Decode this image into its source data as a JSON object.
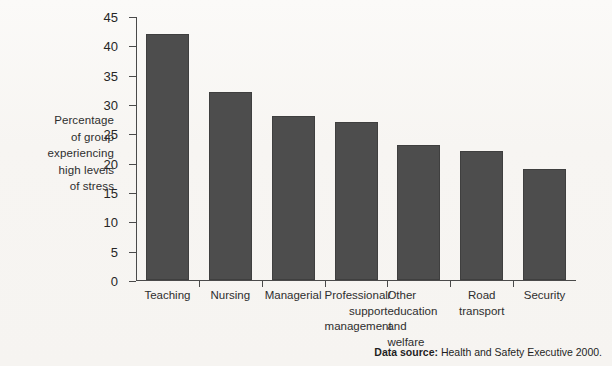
{
  "chart_data": {
    "type": "bar",
    "title": "",
    "xlabel": "",
    "ylabel": "Percentage of group experiencing high levels of stress",
    "ylim": [
      0,
      45
    ],
    "ytick_step": 5,
    "grid": false,
    "legend": "none",
    "bar_color": "#4d4d4d",
    "categories": [
      "Teaching",
      "Nursing",
      "Managerial",
      "Professional/ support management",
      "Other education and welfare",
      "Road transport",
      "Security"
    ],
    "values": [
      42,
      32,
      28,
      27,
      23,
      22,
      19
    ],
    "yticks": [
      "0",
      "5",
      "10",
      "15",
      "20",
      "25",
      "30",
      "35",
      "40",
      "45"
    ]
  },
  "y_axis_title_lines": [
    "Percentage",
    "of group",
    "experiencing",
    "high levels",
    "of stress"
  ],
  "category_labels": [
    {
      "lines": [
        "Teaching"
      ],
      "align": "center"
    },
    {
      "lines": [
        "Nursing"
      ],
      "align": "center"
    },
    {
      "lines": [
        "Managerial"
      ],
      "align": "center"
    },
    {
      "lines": [
        "Professional/",
        "support",
        "management"
      ],
      "align": "right"
    },
    {
      "lines": [
        "Other",
        "education",
        "and",
        "welfare"
      ],
      "align": "left"
    },
    {
      "lines": [
        "Road",
        "transport"
      ],
      "align": "center"
    },
    {
      "lines": [
        "Security"
      ],
      "align": "center"
    }
  ],
  "source": {
    "label": "Data source:",
    "text": "Health and Safety Executive 2000."
  }
}
